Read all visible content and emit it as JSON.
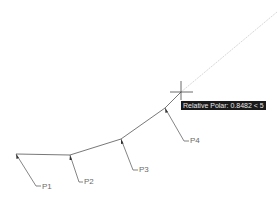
{
  "canvas": {
    "background": "#ffffff",
    "line_color": "#555555",
    "tracking_line_color": "#d8d8d8",
    "crosshair_color": "#444444"
  },
  "tooltip": {
    "text": "Relative Polar: 0.8482 < 5",
    "background": "#1a1a1a",
    "color": "#e8e8e8"
  },
  "points": [
    {
      "id": "P1",
      "label": "P1",
      "x": 16,
      "y": 154
    },
    {
      "id": "P2",
      "label": "P2",
      "x": 70,
      "y": 155
    },
    {
      "id": "P3",
      "label": "P3",
      "x": 121,
      "y": 139
    },
    {
      "id": "P4",
      "label": "P4",
      "x": 165,
      "y": 108
    }
  ],
  "crosshair": {
    "x": 181,
    "y": 92
  }
}
